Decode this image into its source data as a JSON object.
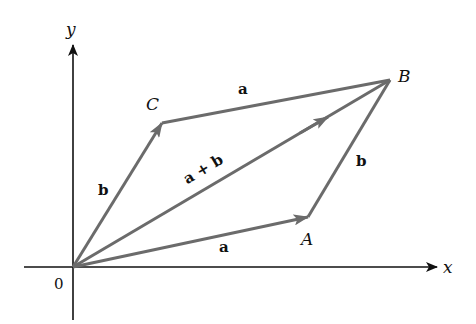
{
  "colors": {
    "axis": "#111111",
    "vector": "#6b6b6b",
    "text": "#111111",
    "background": "#ffffff"
  },
  "axes": {
    "x_label": "x",
    "y_label": "y",
    "origin_label": "0"
  },
  "points": {
    "O": {
      "label": "0",
      "x": 73,
      "y": 267
    },
    "A": {
      "label": "A",
      "x": 308,
      "y": 217
    },
    "B": {
      "label": "B",
      "x": 390,
      "y": 80
    },
    "C": {
      "label": "C",
      "x": 162,
      "y": 123
    }
  },
  "vectors": [
    {
      "from": "O",
      "to": "A",
      "label": "a",
      "arrow": "mid-end"
    },
    {
      "from": "O",
      "to": "C",
      "label": "b",
      "arrow": "mid-end"
    },
    {
      "from": "O",
      "to": "B",
      "label": "a + b",
      "arrow": "mid-end"
    },
    {
      "from": "C",
      "to": "B",
      "label": "a",
      "arrow": "none"
    },
    {
      "from": "A",
      "to": "B",
      "label": "b",
      "arrow": "none"
    }
  ],
  "labels": {
    "point_A": "A",
    "point_B": "B",
    "point_C": "C",
    "vec_OA": "a",
    "vec_OC": "b",
    "vec_OB": "a + b",
    "vec_CB": "a",
    "vec_AB": "b"
  }
}
